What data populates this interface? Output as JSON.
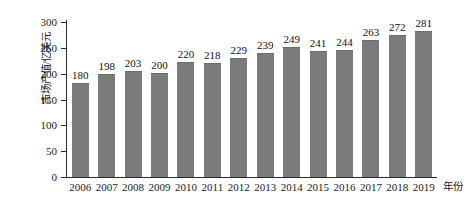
{
  "chart_data": {
    "type": "bar",
    "title": "",
    "subtitle": "",
    "xlabel": "年份",
    "ylabel": "市场产值/亿美元",
    "categories": [
      "2006",
      "2007",
      "2008",
      "2009",
      "2010",
      "2011",
      "2012",
      "2013",
      "2014",
      "2015",
      "2016",
      "2017",
      "2018",
      "2019"
    ],
    "values": [
      180,
      198,
      203,
      200,
      220,
      218,
      229,
      239,
      249,
      241,
      244,
      263,
      272,
      281
    ],
    "value_labels": [
      "180",
      "198",
      "203",
      "200",
      "220",
      "218",
      "229",
      "239",
      "249",
      "241",
      "244",
      "263",
      "272",
      "281"
    ],
    "ylim": [
      0,
      300
    ],
    "yticks": [
      0,
      50,
      100,
      150,
      200,
      250,
      300
    ],
    "ytick_labels": [
      "0",
      "50",
      "100",
      "150",
      "200",
      "250",
      "300"
    ],
    "grid": false,
    "legend": null,
    "series_color": "#7b7b7b",
    "axis_color": "#2b2b2b",
    "text_color": "#1a1a1a"
  }
}
